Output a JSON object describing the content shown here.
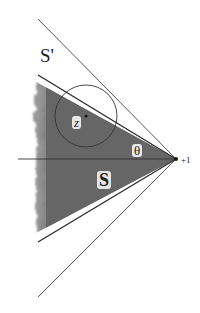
{
  "diagram": {
    "labels": {
      "s_prime": "S'",
      "z": "z",
      "theta": "θ",
      "s": "S",
      "plus_one": "+1"
    },
    "colors": {
      "shaded_region": "#6e6e6e",
      "lines": "#333333",
      "background": "#ffffff"
    },
    "geometry": {
      "vertex": [
        176,
        159
      ],
      "outer_lines": [
        [
          [
            38,
            19
          ],
          [
            176,
            159
          ]
        ],
        [
          [
            38,
            297
          ],
          [
            176,
            159
          ]
        ]
      ],
      "shaded_triangle": [
        [
          38,
          75
        ],
        [
          176,
          159
        ],
        [
          38,
          242
        ]
      ],
      "axis": [
        [
          18,
          159
        ],
        [
          176,
          159
        ]
      ],
      "circle": {
        "center": [
          86,
          116
        ],
        "radius": 31
      }
    }
  }
}
